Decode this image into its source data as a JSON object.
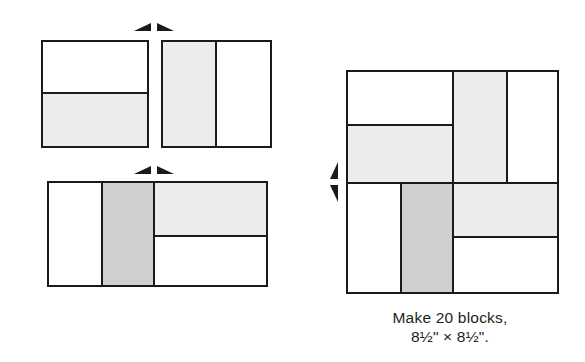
{
  "diagram": {
    "caption": {
      "line1": "Make 20 blocks,",
      "line2": "8½\" × 8½\"."
    },
    "colors": {
      "outline": "#1a1a1a",
      "background": "#ffffff",
      "fabric_white": "#ffffff",
      "fabric_light": "#ececec",
      "fabric_medium": "#e6e6e6",
      "fabric_dark": "#cfcfcf"
    },
    "units": [
      {
        "id": "two-patch-unit",
        "label": "Two-patch unit",
        "patches": [
          {
            "id": "two-patch-top",
            "fabric": "white"
          },
          {
            "id": "two-patch-bottom",
            "fabric": "light"
          }
        ]
      },
      {
        "id": "rail-unit",
        "label": "Two-rail unit",
        "patches": [
          {
            "id": "rail-left",
            "fabric": "light"
          },
          {
            "id": "rail-right",
            "fabric": "white"
          }
        ]
      },
      {
        "id": "partial-block-unit",
        "label": "Partial block unit",
        "patches": [
          {
            "id": "partial-left-white",
            "fabric": "white"
          },
          {
            "id": "partial-center-dark",
            "fabric": "dark"
          },
          {
            "id": "partial-right-top-light",
            "fabric": "light"
          },
          {
            "id": "partial-right-bottom-white",
            "fabric": "white"
          }
        ]
      },
      {
        "id": "finished-block",
        "label": "Finished block",
        "patches": [
          {
            "id": "block-top-left-white",
            "fabric": "white"
          },
          {
            "id": "block-mid-left-light",
            "fabric": "light"
          },
          {
            "id": "block-top-center-light",
            "fabric": "light"
          },
          {
            "id": "block-top-right-white",
            "fabric": "white"
          },
          {
            "id": "block-bottom-left-white",
            "fabric": "white"
          },
          {
            "id": "block-center-dark",
            "fabric": "dark"
          },
          {
            "id": "block-right-mid-light",
            "fabric": "light"
          },
          {
            "id": "block-bottom-right-white",
            "fabric": "white"
          }
        ]
      }
    ],
    "arrows": [
      {
        "id": "arrow-join-top-units",
        "direction": "horizontal",
        "meaning": "join units side by side"
      },
      {
        "id": "arrow-join-bottom-units",
        "direction": "horizontal",
        "meaning": "join units side by side"
      },
      {
        "id": "arrow-join-rows",
        "direction": "vertical",
        "meaning": "join rows top to bottom"
      }
    ]
  }
}
